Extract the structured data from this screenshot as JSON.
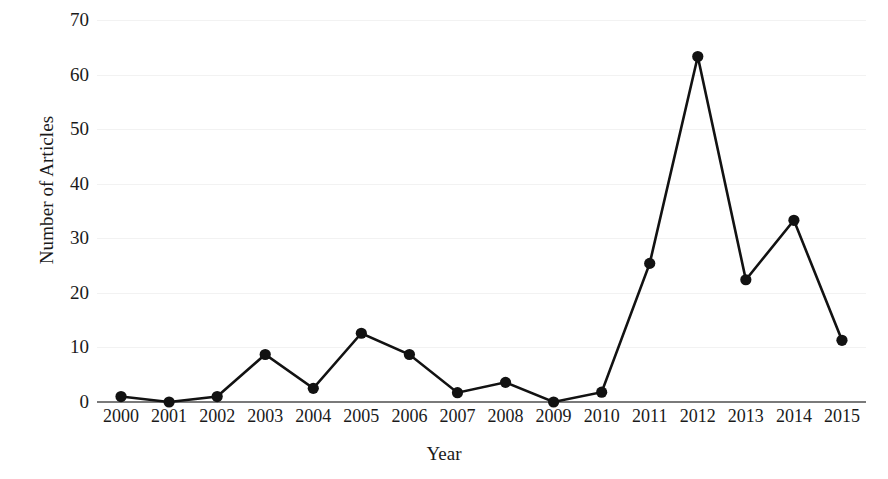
{
  "chart_data": {
    "type": "line",
    "title": "",
    "xlabel": "Year",
    "ylabel": "Number of Articles",
    "categories": [
      "2000",
      "2001",
      "2002",
      "2003",
      "2004",
      "2005",
      "2006",
      "2007",
      "2008",
      "2009",
      "2010",
      "2011",
      "2012",
      "2013",
      "2014",
      "2015"
    ],
    "values": [
      1,
      0,
      1,
      8.7,
      2.5,
      12.6,
      8.7,
      1.7,
      3.6,
      0,
      1.8,
      25.4,
      63.3,
      22.4,
      33.3,
      11.3
    ],
    "series": [
      {
        "name": "Number of Articles",
        "values": [
          1,
          0,
          1,
          8.7,
          2.5,
          12.6,
          8.7,
          1.7,
          3.6,
          0,
          1.8,
          25.4,
          63.3,
          22.4,
          33.3,
          11.3
        ]
      }
    ],
    "ylim": [
      0,
      70
    ],
    "yticks": [
      0,
      10,
      20,
      30,
      40,
      50,
      60,
      70
    ],
    "ytick_labels": [
      "0",
      "10",
      "20",
      "30",
      "40",
      "50",
      "60",
      "70"
    ],
    "xtick_labels": [
      "2000",
      "2001",
      "2002",
      "2003",
      "2004",
      "2005",
      "2006",
      "2007",
      "2008",
      "2009",
      "2010",
      "2011",
      "2012",
      "2013",
      "2014",
      "2015"
    ],
    "grid": true,
    "grid_axis": "y",
    "legend": false,
    "legend_position": "none",
    "marker": "circle",
    "line_color": "#121212",
    "marker_color": "#121212",
    "grid_color": "#f2f2f2",
    "axis_color": "#7a7a7a",
    "background_color": "#ffffff"
  }
}
